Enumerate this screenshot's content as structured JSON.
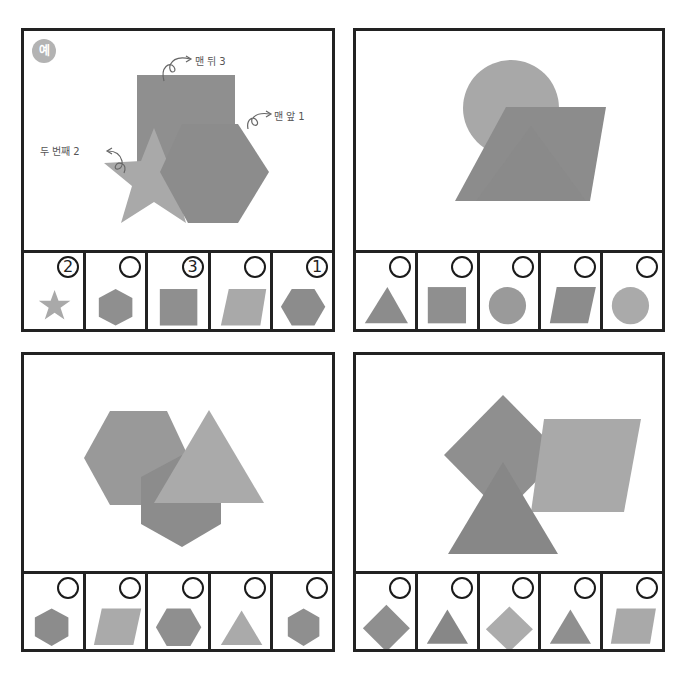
{
  "worksheet": {
    "colors": {
      "dark": "#8a8a8a",
      "mid": "#9c9c9c",
      "light": "#b0b0b0",
      "border": "#222222"
    },
    "panels": [
      {
        "id": "example",
        "badge": "예",
        "scene_shapes_back_to_front": [
          "square",
          "star",
          "hexagon"
        ],
        "annotations": [
          {
            "text": "맨 뒤 3"
          },
          {
            "text": "맨 앞 1"
          },
          {
            "text": "두 번째 2"
          }
        ],
        "options": [
          {
            "shape": "star",
            "shade": "light",
            "answer": "2"
          },
          {
            "shape": "hexagon-pointy",
            "shade": "dark",
            "answer": ""
          },
          {
            "shape": "square",
            "shade": "dark",
            "answer": "3"
          },
          {
            "shape": "parallelogram",
            "shade": "light",
            "answer": ""
          },
          {
            "shape": "hexagon-flat",
            "shade": "dark",
            "answer": "1"
          }
        ]
      },
      {
        "id": "problem-1",
        "scene_shapes_back_to_front": [
          "circle",
          "triangle",
          "parallelogram"
        ],
        "options": [
          {
            "shape": "triangle",
            "shade": "dark",
            "answer": ""
          },
          {
            "shape": "square",
            "shade": "dark",
            "answer": ""
          },
          {
            "shape": "circle",
            "shade": "dark",
            "answer": ""
          },
          {
            "shape": "parallelogram",
            "shade": "dark",
            "answer": ""
          },
          {
            "shape": "circle",
            "shade": "light",
            "answer": ""
          }
        ]
      },
      {
        "id": "problem-2",
        "scene_shapes_back_to_front": [
          "hexagon",
          "hexagon",
          "triangle"
        ],
        "options": [
          {
            "shape": "hexagon-pointy",
            "shade": "dark",
            "answer": ""
          },
          {
            "shape": "parallelogram",
            "shade": "light",
            "answer": ""
          },
          {
            "shape": "hexagon-flat",
            "shade": "dark",
            "answer": ""
          },
          {
            "shape": "triangle",
            "shade": "light",
            "answer": ""
          },
          {
            "shape": "hexagon-pointy",
            "shade": "dark",
            "answer": ""
          }
        ]
      },
      {
        "id": "problem-3",
        "scene_shapes_back_to_front": [
          "diamond",
          "parallelogram",
          "triangle"
        ],
        "options": [
          {
            "shape": "diamond",
            "shade": "dark",
            "answer": ""
          },
          {
            "shape": "triangle",
            "shade": "dark",
            "answer": ""
          },
          {
            "shape": "diamond",
            "shade": "light",
            "answer": ""
          },
          {
            "shape": "triangle",
            "shade": "dark",
            "answer": ""
          },
          {
            "shape": "parallelogram",
            "shade": "light",
            "answer": ""
          }
        ]
      }
    ]
  }
}
